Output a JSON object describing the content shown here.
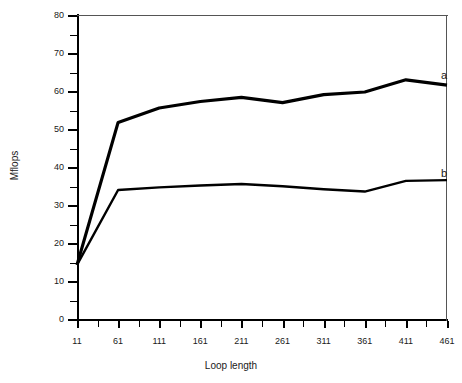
{
  "chart_data": {
    "type": "line",
    "title": "",
    "xlabel": "Loop length",
    "ylabel": "Mflops",
    "xlim": [
      11,
      461
    ],
    "ylim": [
      0,
      80
    ],
    "ytick_step": 10,
    "yminor_step": 5,
    "xtick_step": 50,
    "xminor_step": 25,
    "grid": false,
    "legend_position": "inline-right",
    "xticks": [
      11,
      61,
      111,
      161,
      211,
      261,
      311,
      361,
      411,
      461
    ],
    "xtick_labels": [
      "11",
      "61",
      "111",
      "161",
      "211",
      "261",
      "311",
      "361",
      "411",
      "461"
    ],
    "yticks": [
      0,
      10,
      20,
      30,
      40,
      50,
      60,
      70,
      80
    ],
    "ytick_labels": [
      "0",
      "10",
      "20",
      "30",
      "40",
      "50",
      "60",
      "70",
      "80"
    ],
    "x": [
      11,
      61,
      111,
      161,
      211,
      261,
      311,
      361,
      411,
      461
    ],
    "series": [
      {
        "name": "a",
        "label": "a",
        "color": "#000000",
        "linewidth": 3.2,
        "values": [
          14.5,
          52.0,
          55.8,
          57.5,
          58.6,
          57.2,
          59.3,
          60.0,
          63.2,
          61.8
        ]
      },
      {
        "name": "b",
        "label": "b",
        "color": "#000000",
        "linewidth": 2.4,
        "values": [
          14.5,
          34.2,
          34.9,
          35.4,
          35.8,
          35.2,
          34.4,
          33.8,
          36.6,
          36.8
        ]
      }
    ],
    "annotations": [
      {
        "text": "a",
        "x": 441,
        "y": 70,
        "series": "a"
      },
      {
        "text": "b",
        "x": 441,
        "y": 168,
        "series": "b"
      }
    ]
  },
  "plot_geometry": {
    "left": 77,
    "top": 16,
    "width": 370,
    "height": 304
  }
}
